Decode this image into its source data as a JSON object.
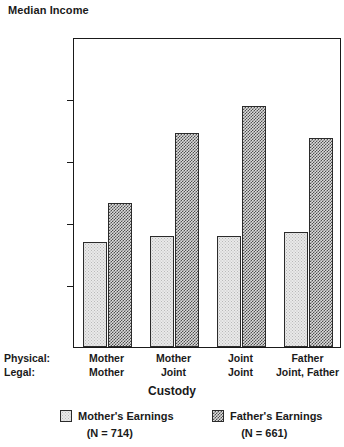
{
  "chart_data": {
    "type": "bar",
    "title": "",
    "ylabel": "Median Income",
    "xlabel": "Custody",
    "ylim": [
      0,
      50000
    ],
    "grid": false,
    "legend_position": "bottom",
    "categories": [
      "Mother / Mother",
      "Mother / Joint",
      "Joint / Joint",
      "Father / Joint, Father"
    ],
    "category_rows": [
      {
        "label": "Physical:",
        "values": [
          "Mother",
          "Mother",
          "Joint",
          "Father"
        ]
      },
      {
        "label": "Legal:",
        "values": [
          "Mother",
          "Joint",
          "Joint",
          "Joint, Father"
        ]
      }
    ],
    "ytick_labels": [
      "$50,000",
      "$40,000",
      "$30,000",
      "$20,000",
      "$10,000"
    ],
    "ytick_values": [
      50000,
      40000,
      30000,
      20000,
      10000
    ],
    "series": [
      {
        "name": "Mother's Earnings",
        "n_label": "(N = 714)",
        "n": 714,
        "values": [
          16900,
          17900,
          17900,
          18500
        ]
      },
      {
        "name": "Father's Earnings",
        "n_label": "(N = 661)",
        "n": 661,
        "values": [
          23300,
          34500,
          38900,
          33700
        ]
      }
    ]
  },
  "colors": {
    "axis": "#1a1a1a",
    "text": "#1a1a1a",
    "mother_fill": "#e9e9e9",
    "father_fill": "#4f4f4f",
    "background": "#ffffff"
  }
}
